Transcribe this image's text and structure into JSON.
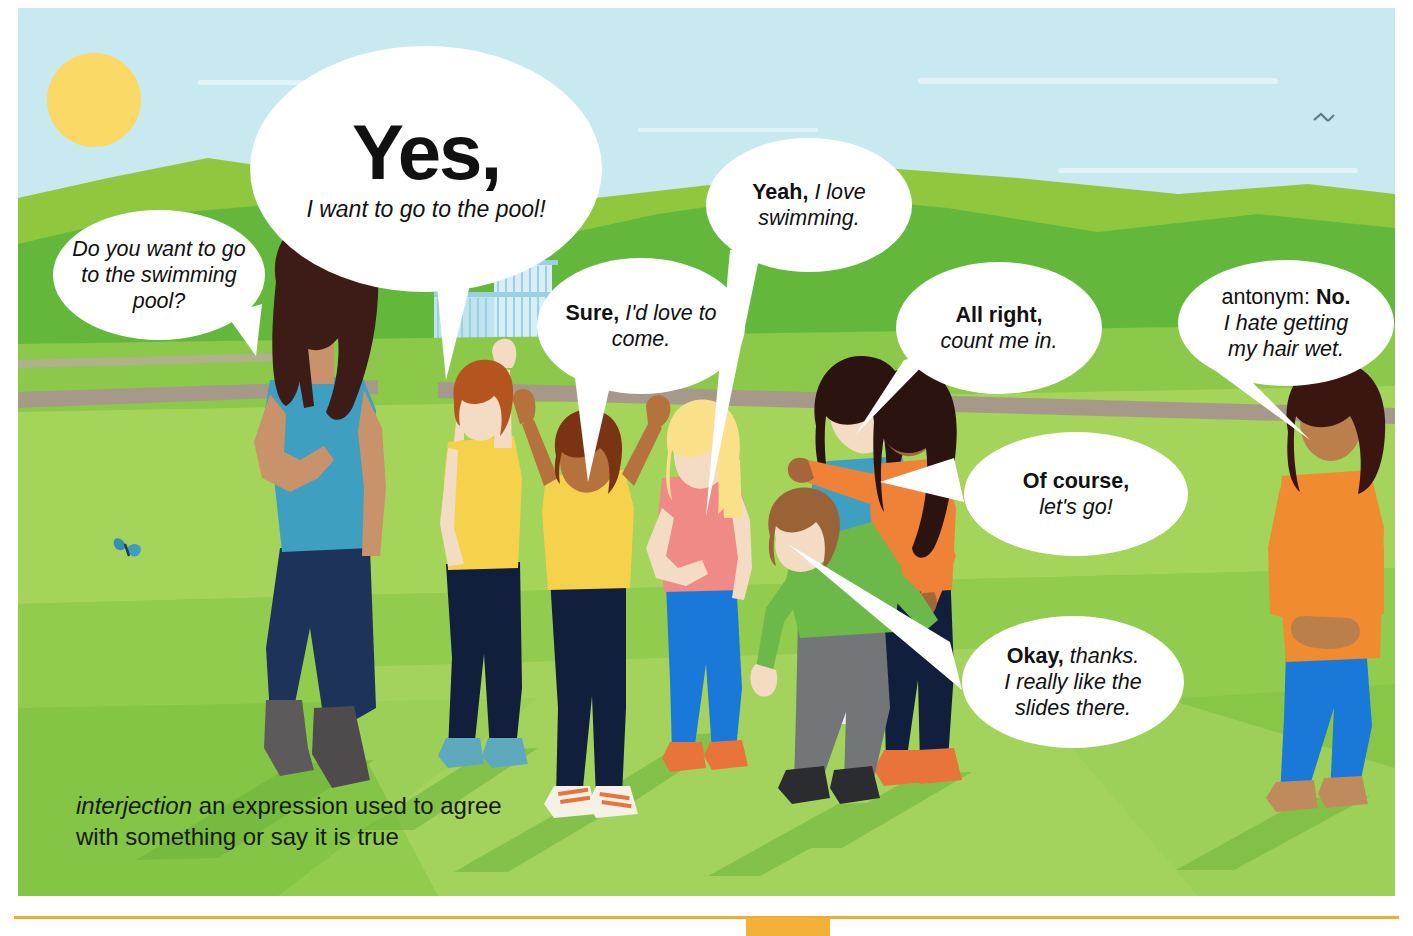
{
  "entry": {
    "headword": "Yes,",
    "headword_example": "I want to go to the pool!",
    "part_of_speech": "interjection",
    "definition": "an expression used to agree with something or say it is true"
  },
  "bubbles": [
    {
      "id": "ask",
      "name": "question-bubble",
      "text": "Do you want to go to the swimming pool?",
      "style": "italic"
    },
    {
      "id": "yes",
      "name": "headword-bubble",
      "bold": "Yes,",
      "italic": "I want to go to the pool!"
    },
    {
      "id": "sure",
      "name": "sure-bubble",
      "bold": "Sure,",
      "italic": "I'd love to come."
    },
    {
      "id": "yeah",
      "name": "yeah-bubble",
      "bold": "Yeah,",
      "italic": "I love swimming."
    },
    {
      "id": "allright",
      "name": "all-right-bubble",
      "bold": "All right,",
      "italic": "count me in."
    },
    {
      "id": "course",
      "name": "of-course-bubble",
      "bold": "Of course,",
      "italic": "let's go!"
    },
    {
      "id": "okay",
      "name": "okay-bubble",
      "bold": "Okay,",
      "italic": "thanks. I really like the slides there."
    },
    {
      "id": "antonym",
      "name": "antonym-bubble",
      "label": "antonym:",
      "bold": "No.",
      "italic": "I hate getting my hair wet."
    }
  ],
  "bubble_text": {
    "ask": "Do you want to go to the swimming pool?",
    "sure_bold": "Sure,",
    "sure_italic": "I'd love to come.",
    "yeah_bold": "Yeah,",
    "yeah_italic": "I love swimming.",
    "allright_bold": "All right,",
    "allright_italic": "count me in.",
    "course_bold": "Of course,",
    "course_italic": "let's go!",
    "okay_bold": "Okay,",
    "okay_italic": "thanks.",
    "okay_italic2": "I really like the",
    "okay_italic3": "slides there.",
    "antonym_label": "antonym:",
    "antonym_bold": "No.",
    "antonym_italic": "I hate getting",
    "antonym_italic2": "my hair wet."
  },
  "scene": {
    "setting": "grassy park field with swimming-pool fence in the background",
    "icons": [
      "sun-icon",
      "butterfly-icon",
      "bird-icon",
      "pool-gate-icon"
    ],
    "figures": [
      {
        "name": "adult-woman-teal",
        "hair": "#3d1b17",
        "top": "#3f9fc0",
        "bottom": "#1d3359",
        "shoes": "#5e5a5c",
        "skin": "#c8936a"
      },
      {
        "name": "boy-yellow-arm-raised",
        "hair": "#b4551f",
        "top": "#f6d24c",
        "bottom": "#121f3c",
        "shoes": "#5fa9bd",
        "skin": "#f3dcc3"
      },
      {
        "name": "child-yellow-arms-up",
        "hair": "#7b3413",
        "top": "#f6d24c",
        "bottom": "#121f3c",
        "shoes": "#f4f1e6",
        "skin": "#b5723c"
      },
      {
        "name": "girl-pink-blonde",
        "hair": "#fbe08a",
        "top": "#f08a86",
        "bottom": "#1a78d8",
        "shoes": "#e8743c",
        "skin": "#f3dcc3"
      },
      {
        "name": "boy-green-bending",
        "hair": "#9a6237",
        "top": "#6cb94a",
        "bottom": "#737679",
        "shoes": "#2b2c30",
        "skin": "#f3dcc3"
      },
      {
        "name": "woman-teal-back",
        "hair": "#2b1410",
        "top": "#3f9fc0",
        "bottom": "#f2f0e6",
        "skin": "#f3dcc3"
      },
      {
        "name": "girl-orange-hugging",
        "hair": "#2b1410",
        "top": "#ef8237",
        "bottom": "#121f3c",
        "shoes": "#e8743c",
        "skin": "#a4663a"
      },
      {
        "name": "woman-orange-right",
        "hair": "#3b150f",
        "top": "#f08b30",
        "bottom": "#1a78d8",
        "shoes": "#c08b5c",
        "skin": "#bb7f4c"
      }
    ]
  },
  "colors": {
    "sky": "#c8e9f0",
    "sun": "#fad966",
    "hill_far": "#8fc83f",
    "hill_mid": "#56b13a",
    "field_light": "#a4d45a",
    "field_mid": "#8cc84a",
    "field_dark": "#74bc3e",
    "path": "#a7998a",
    "bubble_fill": "#ffffff",
    "text": "#111111",
    "definition_text": "#171a0d",
    "rule": "#f0ad2b",
    "tab": "#f3b13a"
  }
}
